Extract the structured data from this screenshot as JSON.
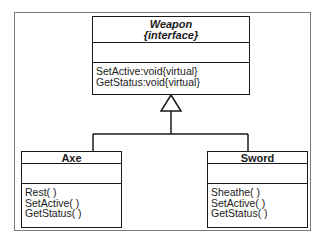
{
  "diagram": {
    "type": "uml-class-diagram",
    "interface": {
      "name": "Weapon",
      "stereotype": "{interface}",
      "attributes": [],
      "operations": [
        "SetActive:void{virtual}",
        "GetStatus:void{virtual}"
      ]
    },
    "classes": [
      {
        "name": "Axe",
        "attributes": [],
        "operations": [
          "Rest( )",
          "SetActive( )",
          "GetStatus( )"
        ]
      },
      {
        "name": "Sword",
        "attributes": [],
        "operations": [
          "Sheathe( )",
          "SetActive( )",
          "GetStatus( )"
        ]
      }
    ],
    "relationships": [
      {
        "from": "Axe",
        "to": "Weapon",
        "type": "generalization"
      },
      {
        "from": "Sword",
        "to": "Weapon",
        "type": "generalization"
      }
    ],
    "colors": {
      "line": "#1a1a1a",
      "frame": "#7a7a7a",
      "background": "#ffffff"
    }
  }
}
